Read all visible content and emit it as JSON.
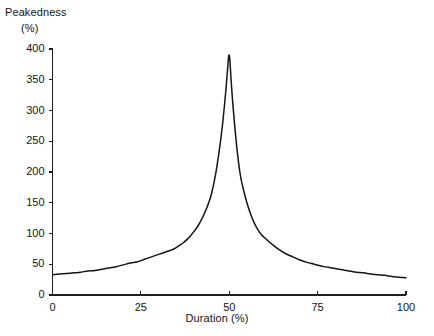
{
  "chart_data": {
    "type": "line",
    "title": "",
    "ylabel": "Peakedness",
    "ylabel_unit": "(%)",
    "xlabel": "Duration (%)",
    "xlim": [
      0,
      100
    ],
    "ylim": [
      0,
      400
    ],
    "grid": false,
    "legend": null,
    "xticks": [
      0,
      25,
      50,
      75,
      100
    ],
    "yticks": [
      0,
      50,
      100,
      150,
      200,
      250,
      300,
      350,
      400
    ],
    "xtick_labels": [
      "0",
      "25",
      "50",
      "75",
      "100"
    ],
    "ytick_labels": [
      "0",
      "50",
      "100",
      "150",
      "200",
      "250",
      "300",
      "350",
      "400"
    ],
    "series": [
      {
        "name": "peakedness",
        "color": "#141414",
        "x": [
          0,
          2,
          4,
          6,
          8,
          10,
          12,
          14,
          16,
          18,
          20,
          22,
          24,
          26,
          28,
          30,
          32,
          34,
          35,
          36,
          37,
          38,
          39,
          40,
          41,
          42,
          43,
          44,
          45,
          46,
          47,
          48,
          49,
          49.5,
          50,
          50.5,
          51,
          52,
          53,
          54,
          55,
          56,
          57,
          58,
          59,
          60,
          62,
          64,
          66,
          68,
          70,
          72,
          74,
          76,
          78,
          80,
          82,
          84,
          86,
          88,
          90,
          92,
          94,
          96,
          98,
          100
        ],
        "y": [
          33,
          34,
          35,
          36,
          37,
          39,
          40,
          42,
          44,
          46,
          49,
          52,
          54,
          58,
          62,
          66,
          70,
          74,
          77,
          81,
          85,
          90,
          96,
          103,
          111,
          121,
          133,
          147,
          165,
          192,
          228,
          272,
          330,
          365,
          390,
          352,
          312,
          248,
          200,
          172,
          150,
          132,
          118,
          107,
          99,
          93,
          83,
          74,
          67,
          62,
          57,
          53,
          50,
          47,
          45,
          43,
          41,
          39,
          37,
          36,
          34,
          33,
          32,
          30,
          29,
          28
        ]
      }
    ]
  },
  "axes": {
    "y_axis_name": "y-axis",
    "x_axis_name": "x-axis"
  }
}
